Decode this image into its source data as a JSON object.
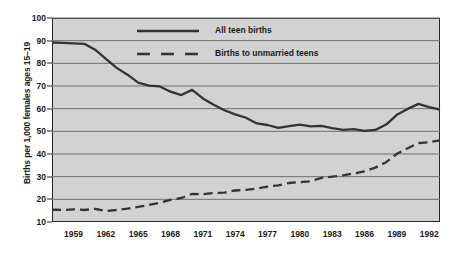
{
  "chart_data": {
    "type": "line",
    "title": "",
    "xlabel": "",
    "ylabel": "Births per 1,000 females ages 15–19",
    "xlim": [
      1957,
      1993
    ],
    "ylim": [
      10,
      100
    ],
    "ytick_labels": [
      "100",
      "90",
      "80",
      "70",
      "60",
      "50",
      "40",
      "30",
      "20",
      "10"
    ],
    "ytick_values": [
      100,
      90,
      80,
      70,
      60,
      50,
      40,
      30,
      20,
      10
    ],
    "xtick_labels": [
      "1959",
      "1962",
      "1965",
      "1968",
      "1971",
      "1974",
      "1977",
      "1980",
      "1983",
      "1986",
      "1989",
      "1992"
    ],
    "xtick_values": [
      1959,
      1962,
      1965,
      1968,
      1971,
      1974,
      1977,
      1980,
      1983,
      1986,
      1989,
      1992
    ],
    "grid": "horizontal",
    "legend_position": "top-center",
    "plot_background": "#d2d2d2",
    "line_color": "#333333",
    "grid_color": "#6f6f6f",
    "axis_color": "#262626",
    "x": [
      1957,
      1958,
      1959,
      1960,
      1961,
      1962,
      1963,
      1964,
      1965,
      1966,
      1967,
      1968,
      1969,
      1970,
      1971,
      1972,
      1973,
      1974,
      1975,
      1976,
      1977,
      1978,
      1979,
      1980,
      1981,
      1982,
      1983,
      1984,
      1985,
      1986,
      1987,
      1988,
      1989,
      1990,
      1991,
      1992,
      1993
    ],
    "series": [
      {
        "name": "All teen births",
        "style": "solid",
        "values": [
          89.2,
          89.0,
          88.8,
          88.6,
          86.0,
          82.0,
          78.0,
          75.0,
          71.5,
          70.2,
          69.8,
          67.5,
          66.0,
          68.3,
          64.5,
          61.7,
          59.3,
          57.5,
          56.0,
          53.5,
          52.8,
          51.5,
          52.3,
          53.0,
          52.2,
          52.4,
          51.4,
          50.6,
          51.0,
          50.2,
          50.6,
          53.0,
          57.3,
          59.9,
          62.1,
          60.7,
          59.6
        ]
      },
      {
        "name": "Births to unmarried teens",
        "style": "dashed",
        "values": [
          15.4,
          15.3,
          15.6,
          15.3,
          15.8,
          14.8,
          15.3,
          15.9,
          16.7,
          17.5,
          18.5,
          19.8,
          20.6,
          22.4,
          22.3,
          22.8,
          23.0,
          23.9,
          24.2,
          24.7,
          25.6,
          26.2,
          27.2,
          27.6,
          28.0,
          29.5,
          30.0,
          30.6,
          31.4,
          32.3,
          34.0,
          36.4,
          40.1,
          42.5,
          44.8,
          45.2,
          46.0
        ]
      }
    ],
    "legend": [
      {
        "label": "All teen births",
        "style": "solid"
      },
      {
        "label": "Births to unmarried teens",
        "style": "dashed"
      }
    ]
  }
}
